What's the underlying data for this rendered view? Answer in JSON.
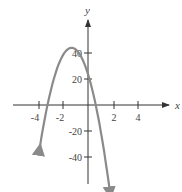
{
  "chart_data": {
    "type": "line",
    "title": "",
    "xlabel": "x",
    "ylabel": "y",
    "xlim": [
      -5.5,
      6
    ],
    "ylim": [
      -60,
      60
    ],
    "grid": false,
    "x_ticks": [
      -4,
      -2,
      2,
      4
    ],
    "x_tick_labels": [
      "-4",
      "-2",
      "2",
      "4"
    ],
    "y_ticks": [
      40,
      20,
      -20,
      -40
    ],
    "y_tick_labels": [
      "40",
      "20",
      "-20",
      "-40"
    ],
    "series": [
      {
        "name": "parabola",
        "description": "downward-opening parabola, vertex approx (-1.3, 44), y-intercept approx 24, x-intercepts approx -3.2 and 0.6",
        "x": [
          -3.8,
          -3.2,
          -2.5,
          -2.0,
          -1.6,
          -1.3,
          -1.0,
          -0.6,
          0.0,
          0.6,
          1.2,
          1.7
        ],
        "y": [
          -31,
          0,
          27,
          38,
          43,
          44,
          43,
          38,
          24,
          0,
          -31,
          -56
        ],
        "color": "#8a8a8a",
        "arrows_at_ends": true
      }
    ]
  },
  "labels": {
    "x_axis": "x",
    "y_axis": "y"
  }
}
